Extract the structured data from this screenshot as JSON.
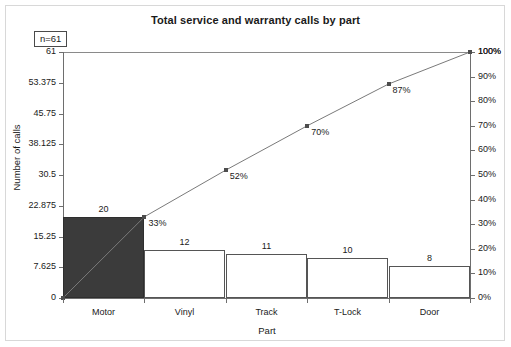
{
  "chart_data": {
    "type": "bar",
    "title": "Total service and warranty calls by part",
    "xlabel": "Part",
    "ylabel": "Number of calls",
    "y2label": "",
    "categories": [
      "Motor",
      "Vinyl",
      "Track",
      "T-Lock",
      "Door"
    ],
    "values": [
      20,
      12,
      11,
      10,
      8
    ],
    "cumulative_percent": [
      33,
      52,
      70,
      87,
      100
    ],
    "cumulative_labels": [
      "33%",
      "52%",
      "70%",
      "87%",
      "100%"
    ],
    "bar_labels": [
      "20",
      "12",
      "11",
      "10",
      "8"
    ],
    "ylim": [
      0,
      61
    ],
    "y2lim": [
      0,
      100
    ],
    "yticks": [
      0,
      7.625,
      15.25,
      22.875,
      30.5,
      38.125,
      45.75,
      53.375,
      61
    ],
    "ytick_labels": [
      "0",
      "7.625",
      "15.25",
      "22.875",
      "30.5",
      "38.125",
      "45.75",
      "53.375",
      "61"
    ],
    "y2ticks": [
      0,
      10,
      20,
      30,
      40,
      50,
      60,
      70,
      80,
      90,
      100
    ],
    "y2tick_labels": [
      "0%",
      "10%",
      "20%",
      "30%",
      "40%",
      "50%",
      "60%",
      "70%",
      "80%",
      "90%",
      "100%"
    ],
    "grid": false,
    "legend": "none",
    "sample_size_label": "n=61",
    "highlight_index": 0,
    "colors": {
      "highlight_bar": "#3b3b3b",
      "bar_outline": "#555555",
      "bar_fill": "#ffffff",
      "line": "#7a7a7a",
      "marker": "#4d4d4d",
      "axis": "#6e6e6e",
      "text": "#1a1a1a",
      "frame": "#d8d8d8",
      "background": "#ffffff"
    }
  }
}
